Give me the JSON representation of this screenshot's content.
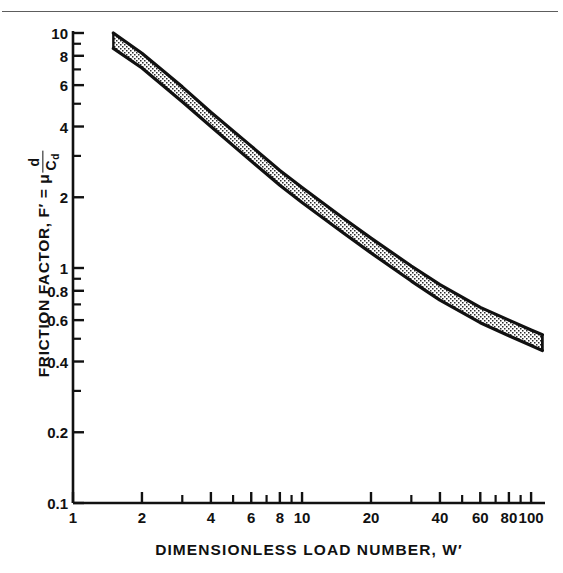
{
  "figure": {
    "kind": "log-log-band-chart",
    "background_color": "#ffffff",
    "ink_color": "#111111",
    "rule_color": "#5d5d5d"
  },
  "axes": {
    "y": {
      "title_prefix": "FRICTION FACTOR, F′ = μ",
      "title_fraction_numerator": "d",
      "title_fraction_denominator": "C",
      "title_fraction_denominator_sub": "d",
      "tick_labels": [
        "10",
        "8",
        "6",
        "4",
        "2",
        "1",
        "0.8",
        "0.6",
        "0.4",
        "0.2",
        "0.1"
      ],
      "tick_values": [
        10,
        8,
        6,
        4,
        2,
        1,
        0.8,
        0.6,
        0.4,
        0.2,
        0.1
      ],
      "minor_tick_values": [
        9,
        7,
        5,
        3,
        0.9,
        0.7,
        0.5,
        0.3
      ],
      "range": [
        0.1,
        10
      ],
      "scale": "log"
    },
    "x": {
      "title": "DIMENSIONLESS LOAD NUMBER, W′",
      "tick_labels": [
        "1",
        "2",
        "4",
        "6",
        "8",
        "10",
        "20",
        "40",
        "60",
        "80",
        "100"
      ],
      "tick_values": [
        1,
        2,
        4,
        6,
        8,
        10,
        20,
        40,
        60,
        80,
        100
      ],
      "minor_tick_values": [
        3,
        5,
        7,
        9,
        30,
        50,
        70,
        90
      ],
      "range": [
        1,
        115
      ],
      "scale": "log"
    }
  },
  "chart_data": {
    "type": "area",
    "title": "",
    "xlabel": "DIMENSIONLESS LOAD NUMBER, W′",
    "ylabel": "FRICTION FACTOR, F′ = μ d/Cd",
    "xlim": [
      1,
      115
    ],
    "ylim": [
      0.1,
      10
    ],
    "xscale": "log",
    "yscale": "log",
    "grid": false,
    "legend": null,
    "band_fill": "stipple",
    "band_edge_color": "#111111",
    "series": [
      {
        "name": "upper bound",
        "x": [
          1.5,
          2,
          3,
          4,
          6,
          8,
          10,
          15,
          20,
          30,
          40,
          60,
          80,
          100,
          112
        ],
        "values": [
          10.0,
          8.2,
          5.9,
          4.6,
          3.3,
          2.6,
          2.2,
          1.64,
          1.34,
          1.02,
          0.85,
          0.68,
          0.6,
          0.545,
          0.52
        ]
      },
      {
        "name": "lower bound",
        "x": [
          1.5,
          2,
          3,
          4,
          6,
          8,
          10,
          15,
          20,
          30,
          40,
          60,
          80,
          100,
          112
        ],
        "values": [
          8.6,
          7.1,
          5.1,
          4.0,
          2.85,
          2.25,
          1.9,
          1.42,
          1.16,
          0.88,
          0.73,
          0.585,
          0.515,
          0.468,
          0.445
        ]
      }
    ]
  }
}
